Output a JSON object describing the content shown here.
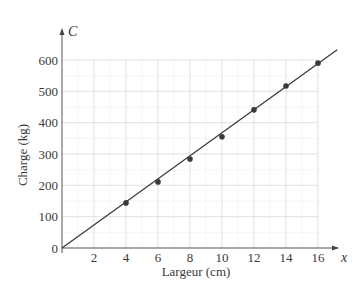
{
  "chart_data": {
    "type": "scatter",
    "title": "",
    "xlabel": "Largeur (cm)",
    "ylabel": "Charge (kg)",
    "x_axis_var": "x",
    "y_axis_var": "C",
    "xlim": [
      0,
      17
    ],
    "ylim": [
      0,
      640
    ],
    "x_ticks": [
      2,
      4,
      6,
      8,
      10,
      12,
      14,
      16
    ],
    "y_ticks": [
      0,
      100,
      200,
      300,
      400,
      500,
      600
    ],
    "grid": true,
    "series": [
      {
        "name": "Données",
        "type": "scatter",
        "x": [
          4,
          6,
          8,
          10,
          12,
          14,
          16
        ],
        "y": [
          144,
          211,
          284,
          355,
          441,
          517,
          590
        ]
      },
      {
        "name": "Droite de régression",
        "type": "line",
        "x": [
          0,
          17.2
        ],
        "y": [
          0,
          633
        ]
      }
    ]
  }
}
